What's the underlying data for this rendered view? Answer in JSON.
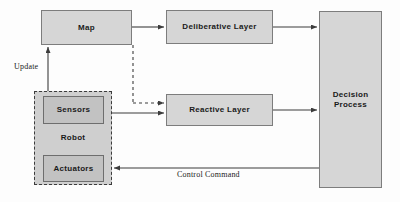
{
  "diagram": {
    "type": "block-diagram",
    "background_color": "#fdfdfd",
    "node_fill_color": "#d6d6d6",
    "inner_node_fill_color": "#c2c2c2",
    "group_fill_color": "#cfcfcf",
    "stroke_color": "#3c3c3c"
  },
  "nodes": {
    "map": {
      "label": "Map"
    },
    "deliberative": {
      "label": "Deliberative Layer"
    },
    "reactive": {
      "label": "Reactive Layer"
    },
    "decision": {
      "label": "Decision\nProcess",
      "line1": "Decision",
      "line2": "Process"
    },
    "robot_group": {
      "label": "Robot"
    },
    "sensors": {
      "label": "Sensors"
    },
    "actuators": {
      "label": "Actuators"
    }
  },
  "edges": [
    {
      "id": "sensors-to-map",
      "from": "sensors",
      "to": "map",
      "label": "Update",
      "style": "solid",
      "direction": "up"
    },
    {
      "id": "map-to-deliberative",
      "from": "map",
      "to": "deliberative",
      "label": "",
      "style": "solid",
      "direction": "right"
    },
    {
      "id": "map-to-reactive",
      "from": "map",
      "to": "reactive",
      "label": "",
      "style": "dashed",
      "direction": "right"
    },
    {
      "id": "sensors-to-reactive",
      "from": "sensors",
      "to": "reactive",
      "label": "",
      "style": "solid",
      "direction": "right"
    },
    {
      "id": "deliberative-to-decision",
      "from": "deliberative",
      "to": "decision",
      "label": "",
      "style": "solid",
      "direction": "right"
    },
    {
      "id": "reactive-to-decision",
      "from": "reactive",
      "to": "decision",
      "label": "",
      "style": "solid",
      "direction": "right"
    },
    {
      "id": "decision-to-actuators",
      "from": "decision",
      "to": "actuators",
      "label": "Control Command",
      "style": "solid",
      "direction": "left"
    }
  ],
  "edge_labels": {
    "update": "Update",
    "control_command": "Control Command"
  }
}
